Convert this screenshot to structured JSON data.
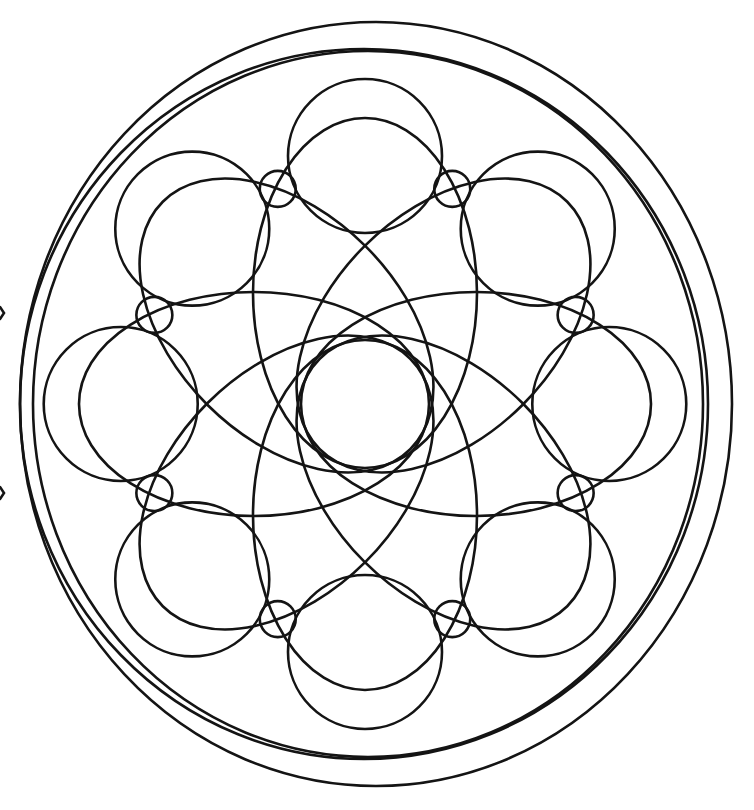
{
  "style": {
    "background": "#ffffff",
    "stroke_color": "#141414",
    "stroke_width": 2.6
  },
  "mandala": {
    "center": [
      365,
      404
    ],
    "outer_ring": {
      "cx": 376,
      "cy": 404,
      "rx": 356,
      "ry": 382
    },
    "outer_ring_2": {
      "cx": 364,
      "cy": 404,
      "rx": 344,
      "ry": 355
    },
    "inner_ring": {
      "cx": 368,
      "cy": 404,
      "rx": 335,
      "ry": 353
    },
    "petal_ellipses": {
      "count": 8,
      "rx": 175,
      "ry": 112,
      "distance_from_center": 111,
      "angles_deg": [
        0,
        45,
        90,
        135,
        180,
        225,
        270,
        315
      ]
    },
    "large_circles": {
      "count": 8,
      "r": 77,
      "distance_from_center": 248,
      "angles_deg": [
        0,
        45,
        90,
        135,
        180,
        225,
        270,
        315
      ]
    },
    "small_circles": {
      "count": 8,
      "r": 18,
      "distance_from_center": 240,
      "angles_deg": [
        22.5,
        67.5,
        112.5,
        157.5,
        202.5,
        247.5,
        292.5,
        337.5
      ]
    },
    "left_notches": [
      [
        2,
        313
      ],
      [
        2,
        493
      ]
    ]
  }
}
